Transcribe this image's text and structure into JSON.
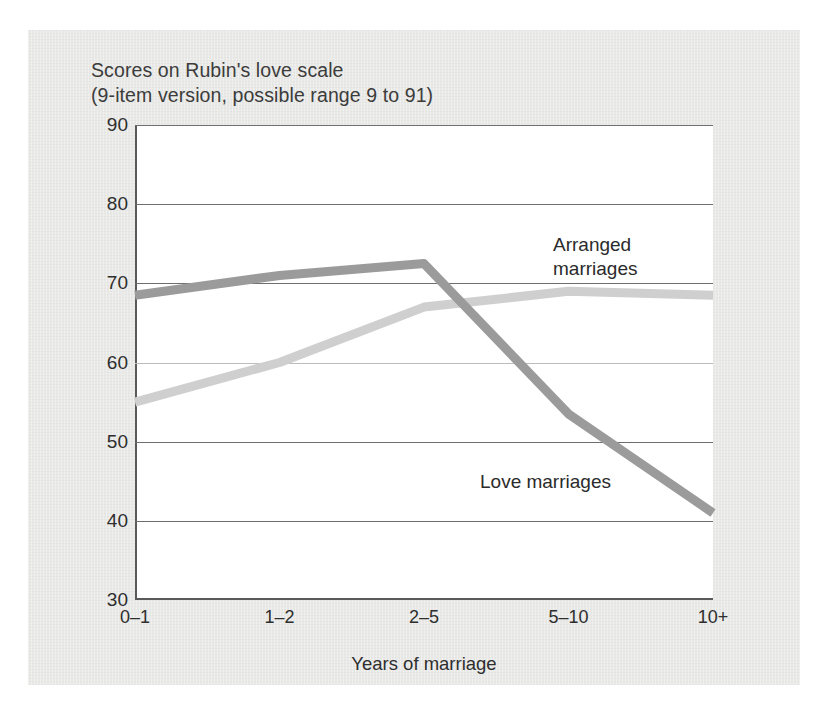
{
  "figure": {
    "background_color": "#e9e9e7",
    "plot_background_color": "#ffffff",
    "axis_color": "#5a5a5a"
  },
  "chart_data": {
    "type": "line",
    "title": "Scores on Rubin's love scale\n(9-item version, possible range 9 to 91)",
    "title_line_1": "Scores on Rubin's love scale",
    "title_line_2": "(9-item version, possible range 9 to 91)",
    "xlabel": "Years of marriage",
    "ylabel": "",
    "categories": [
      "0–1",
      "1–2",
      "2–5",
      "5–10",
      "10+"
    ],
    "ylim": [
      30,
      90
    ],
    "yticks": [
      90,
      80,
      70,
      60,
      50,
      40,
      30
    ],
    "grid": true,
    "legend": "inline-annotations",
    "series": [
      {
        "name": "Arranged marriages",
        "values": [
          55,
          60,
          67,
          69,
          68.5
        ],
        "color": "#cfcfcf",
        "line_width": 9
      },
      {
        "name": "Love marriages",
        "values": [
          68.5,
          71,
          72.5,
          53.5,
          41
        ],
        "color": "#9b9b9b",
        "line_width": 9
      }
    ],
    "annotations": [
      {
        "text": "Arranged\nmarriages",
        "line_1": "Arranged",
        "line_2": "marriages",
        "series": "Arranged marriages"
      },
      {
        "text": "Love marriages",
        "line_1": "Love marriages",
        "series": "Love marriages"
      }
    ]
  }
}
